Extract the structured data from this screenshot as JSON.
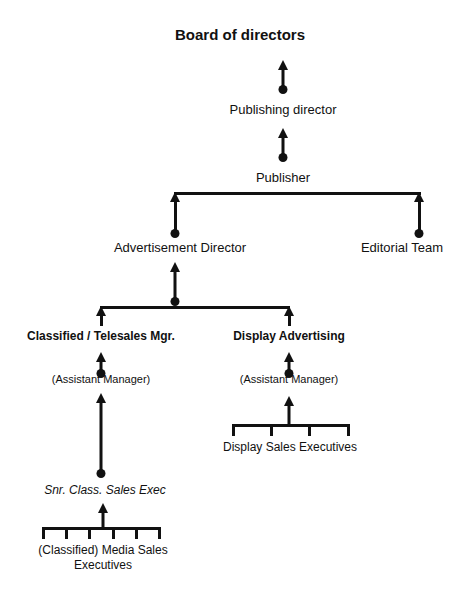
{
  "diagram": {
    "type": "organization-chart",
    "title": "Board of directors",
    "orientation": "bottom-up-reporting",
    "colors": {
      "line": "#111111",
      "text": "#111111",
      "background": "#ffffff"
    },
    "nodes": {
      "board": {
        "label": "Board of directors",
        "style": "bold",
        "font_size": 15
      },
      "publishing_director": {
        "label": "Publishing director",
        "style": "regular",
        "font_size": 13
      },
      "publisher": {
        "label": "Publisher",
        "style": "regular",
        "font_size": 13
      },
      "advertisement_director": {
        "label": "Advertisement Director",
        "style": "regular",
        "font_size": 13
      },
      "editorial_team": {
        "label": "Editorial Team",
        "style": "regular",
        "font_size": 13
      },
      "classified_mgr": {
        "label": "Classified / Telesales Mgr.",
        "style": "bold",
        "font_size": 12
      },
      "display_advertising": {
        "label": "Display Advertising",
        "style": "bold",
        "font_size": 12
      },
      "classified_assistant": {
        "label": "(Assistant Manager)",
        "style": "regular",
        "font_size": 11
      },
      "display_assistant": {
        "label": "(Assistant Manager)",
        "style": "regular",
        "font_size": 11
      },
      "display_sales_execs": {
        "label": "Display Sales Executives",
        "style": "regular",
        "font_size": 12
      },
      "snr_class_sales_exec": {
        "label": "Snr. Class. Sales Exec",
        "style": "italic",
        "font_size": 12
      },
      "media_sales_line1": {
        "label": "(Classified) Media Sales",
        "style": "regular",
        "font_size": 12
      },
      "media_sales_line2": {
        "label": "Executives",
        "style": "regular",
        "font_size": 12
      }
    }
  }
}
